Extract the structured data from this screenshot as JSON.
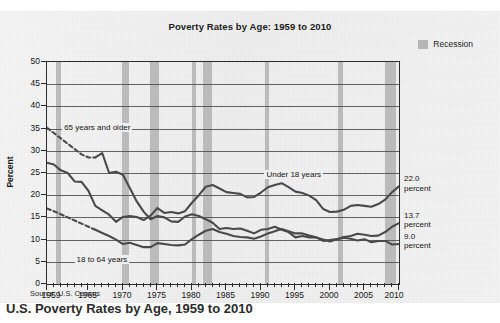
{
  "top_strip": {
    "clipped_text": "·  ·   ·  ·    ·   ·   ·  ·     ·    ·      ·   ·   ·    ·"
  },
  "figure": {
    "title": "Poverty Rates by Age: 1959 to 2010",
    "source": "Source: U.S. Census",
    "legend": {
      "swatch_color": "#b6b6b6",
      "label": "Recession"
    },
    "ylabel": "Percent",
    "annotations": [
      {
        "text": "65 years and older"
      },
      {
        "text": "Under 18 years"
      },
      {
        "text": "18 to 64 years"
      }
    ],
    "callouts": [
      {
        "value": "22.0",
        "unit": "percent"
      },
      {
        "value": "13.7",
        "unit": "percent"
      },
      {
        "value": "9.0",
        "unit": "percent"
      }
    ]
  },
  "caption": {
    "text": "U.S. Poverty Rates by Age, 1959 to 2010"
  },
  "chart_data": {
    "type": "line",
    "title": "Poverty Rates by Age: 1959 to 2010",
    "xlabel": "",
    "ylabel": "Percent",
    "xlim": [
      1959,
      2010
    ],
    "ylim": [
      0,
      50
    ],
    "ytick_step": 5,
    "yticks": [
      0,
      5,
      10,
      15,
      20,
      25,
      30,
      35,
      40,
      45,
      50
    ],
    "xticks": [
      1959,
      1965,
      1970,
      1975,
      1980,
      1985,
      1990,
      1995,
      2000,
      2005,
      2010
    ],
    "xtick_minor_step": 1,
    "grid": "horizontal",
    "legend_position": "top-right",
    "line_color": "#4a4a4a",
    "recession_color": "#b6b6b6",
    "x": [
      1959,
      1960,
      1961,
      1962,
      1963,
      1964,
      1965,
      1966,
      1967,
      1968,
      1969,
      1970,
      1971,
      1972,
      1973,
      1974,
      1975,
      1976,
      1977,
      1978,
      1979,
      1980,
      1981,
      1982,
      1983,
      1984,
      1985,
      1986,
      1987,
      1988,
      1989,
      1990,
      1991,
      1992,
      1993,
      1994,
      1995,
      1996,
      1997,
      1998,
      1999,
      2000,
      2001,
      2002,
      2003,
      2004,
      2005,
      2006,
      2007,
      2008,
      2009,
      2010
    ],
    "series": [
      {
        "name": "65 years and older",
        "end_value": 9.0,
        "end_label": "9.0 percent",
        "dashed_range": [
          1959,
          1966
        ],
        "values": [
          35.2,
          34.0,
          32.8,
          31.6,
          30.4,
          29.2,
          28.5,
          28.5,
          29.5,
          25.0,
          25.3,
          24.6,
          21.6,
          18.6,
          16.3,
          14.6,
          15.3,
          15.0,
          14.1,
          14.0,
          15.2,
          15.7,
          15.3,
          14.6,
          13.8,
          12.4,
          12.6,
          12.4,
          12.5,
          12.0,
          11.4,
          12.2,
          12.4,
          12.9,
          12.2,
          11.7,
          10.5,
          10.8,
          10.5,
          10.5,
          9.7,
          9.9,
          10.1,
          10.4,
          10.2,
          9.8,
          10.1,
          9.4,
          9.7,
          9.7,
          8.9,
          9.0
        ]
      },
      {
        "name": "Under 18 years",
        "end_value": 22.0,
        "end_label": "22.0 percent",
        "dashed_range": null,
        "values": [
          27.3,
          26.9,
          25.6,
          25.0,
          23.1,
          23.0,
          21.0,
          17.6,
          16.6,
          15.6,
          14.0,
          15.1,
          15.3,
          15.1,
          14.4,
          15.4,
          17.1,
          16.0,
          16.2,
          15.9,
          16.4,
          18.3,
          20.0,
          21.9,
          22.3,
          21.5,
          20.7,
          20.5,
          20.3,
          19.5,
          19.6,
          20.6,
          21.8,
          22.3,
          22.7,
          21.8,
          20.8,
          20.5,
          19.9,
          18.9,
          16.9,
          16.2,
          16.3,
          16.7,
          17.6,
          17.8,
          17.6,
          17.4,
          18.0,
          19.0,
          20.7,
          22.0
        ]
      },
      {
        "name": "18 to 64 years",
        "end_value": 13.7,
        "end_label": "13.7 percent",
        "dashed_range": [
          1959,
          1966
        ],
        "values": [
          17.0,
          16.4,
          15.7,
          15.0,
          14.3,
          13.6,
          12.9,
          12.2,
          11.5,
          10.8,
          10.0,
          9.0,
          9.3,
          8.8,
          8.3,
          8.3,
          9.2,
          9.0,
          8.8,
          8.7,
          8.9,
          10.1,
          11.1,
          12.0,
          12.4,
          11.7,
          11.3,
          10.8,
          10.6,
          10.5,
          10.2,
          10.7,
          11.4,
          11.9,
          12.4,
          11.9,
          11.4,
          11.4,
          10.9,
          10.5,
          10.0,
          9.6,
          10.1,
          10.6,
          10.8,
          11.3,
          11.1,
          10.8,
          10.9,
          11.7,
          12.9,
          13.7
        ]
      }
    ],
    "recessions": [
      {
        "start": 1960.3,
        "end": 1961.1
      },
      {
        "start": 1969.9,
        "end": 1970.9
      },
      {
        "start": 1973.9,
        "end": 1975.2
      },
      {
        "start": 1980.0,
        "end": 1980.6
      },
      {
        "start": 1981.6,
        "end": 1982.9
      },
      {
        "start": 1990.6,
        "end": 1991.2
      },
      {
        "start": 2001.2,
        "end": 2001.9
      },
      {
        "start": 2007.9,
        "end": 2009.5
      }
    ]
  }
}
